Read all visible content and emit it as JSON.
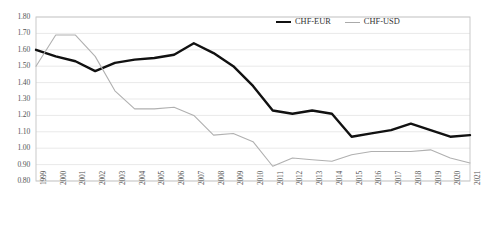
{
  "chart_data": {
    "type": "line",
    "title": "",
    "xlabel": "",
    "ylabel": "",
    "ylim": [
      0.8,
      1.8
    ],
    "ytick_step": 0.1,
    "grid": true,
    "legend_position": "top-center-right",
    "categories": [
      "1999",
      "2000",
      "2001",
      "2002",
      "2003",
      "2004",
      "2005",
      "2006",
      "2007",
      "2008",
      "2009",
      "2010",
      "2011",
      "2012",
      "2013",
      "2014",
      "2015",
      "2016",
      "2017",
      "2018",
      "2019",
      "2020",
      "2021"
    ],
    "ytick_labels": [
      "1.80",
      "1.70",
      "1.60",
      "1.50",
      "1.40",
      "1.30",
      "1.20",
      "1.10",
      "1.00",
      "0.90",
      "0.80"
    ],
    "series": [
      {
        "name": "CHF-EUR",
        "color": "#111111",
        "width": 2.4,
        "values": [
          1.6,
          1.56,
          1.53,
          1.47,
          1.52,
          1.54,
          1.55,
          1.57,
          1.64,
          1.58,
          1.5,
          1.38,
          1.23,
          1.21,
          1.23,
          1.21,
          1.07,
          1.09,
          1.11,
          1.15,
          1.11,
          1.07,
          1.08
        ]
      },
      {
        "name": "CHF-USD",
        "color": "#b0b0b0",
        "width": 1.1,
        "values": [
          1.5,
          1.69,
          1.69,
          1.56,
          1.35,
          1.24,
          1.24,
          1.25,
          1.2,
          1.08,
          1.09,
          1.04,
          0.89,
          0.94,
          0.93,
          0.92,
          0.96,
          0.98,
          0.98,
          0.98,
          0.99,
          0.94,
          0.91
        ]
      }
    ]
  },
  "legend": {
    "items": [
      {
        "label": "CHF-EUR"
      },
      {
        "label": "CHF-USD"
      }
    ]
  }
}
